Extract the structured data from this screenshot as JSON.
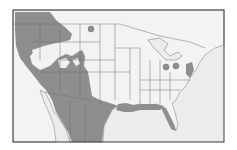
{
  "map": {
    "type": "species-range-map",
    "region": "North America (United States, northern Mexico, southern Canada)",
    "colors": {
      "background": "#ffffff",
      "ocean": "#ececec",
      "land": "#f2f2f2",
      "range_fill": "#8e8e8e",
      "range_fill_light": "#a5a5a5",
      "borders": "#6e6e6e",
      "frame": "#3a3a3a"
    },
    "legend": [],
    "range_areas": [
      {
        "name": "western-range",
        "description": "Pacific coast, Great Basin, Rocky Mountains, Southwest and Mexico"
      },
      {
        "name": "gulf-coast-range",
        "description": "Gulf coast from Texas to Florida panhandle"
      },
      {
        "name": "florida-range",
        "description": "Florida peninsula"
      },
      {
        "name": "chesapeake-range",
        "description": "Mid-Atlantic coast"
      }
    ],
    "isolated_records": [
      {
        "name": "north-dakota-record"
      },
      {
        "name": "ohio-record"
      },
      {
        "name": "west-virginia-record"
      }
    ]
  }
}
